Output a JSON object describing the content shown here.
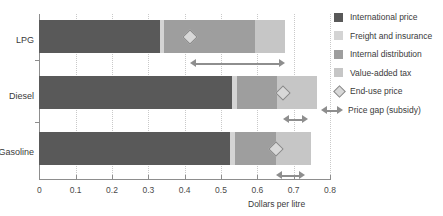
{
  "chart_data": {
    "type": "bar",
    "orientation": "horizontal",
    "stacked": true,
    "title": "",
    "xlabel": "Dollars per litre",
    "ylabel": "",
    "xlim": [
      0,
      0.8
    ],
    "xticks": [
      0,
      0.1,
      0.2,
      0.3,
      0.4,
      0.5,
      0.6,
      0.7,
      0.8
    ],
    "xtick_labels": [
      "0",
      "0.1",
      "0.2",
      "0.3",
      "0.4",
      "0.5",
      "0.6",
      "0.7",
      "0.8"
    ],
    "grid": "vertical-dotted",
    "legend_position": "right",
    "categories": [
      "LPG",
      "Diesel",
      "Gasoline"
    ],
    "series": [
      {
        "name": "International price",
        "color": "#595959",
        "values": [
          0.332,
          0.53,
          0.525
        ]
      },
      {
        "name": "Freight and insurance",
        "color": "#d4d4d4",
        "values": [
          0.012,
          0.015,
          0.013
        ]
      },
      {
        "name": "Internal distribution",
        "color": "#9e9e9e",
        "values": [
          0.249,
          0.109,
          0.113
        ]
      },
      {
        "name": "Value-added tax",
        "color": "#c6c6c6",
        "values": [
          0.083,
          0.11,
          0.097
        ]
      }
    ],
    "end_use_price": {
      "name": "End-use price",
      "marker": "diamond",
      "color": "#d8d8d8",
      "edge_color": "#8a8a8a",
      "values": [
        0.415,
        0.671,
        0.652
      ]
    },
    "price_gap": {
      "name": "Price gap (subsidy)",
      "color": "#8e8e8e",
      "ranges": [
        {
          "category": "LPG",
          "start": 0.415,
          "end": 0.676
        },
        {
          "category": "Diesel",
          "start": 0.671,
          "end": 0.74
        },
        {
          "category": "Gasoline",
          "start": 0.652,
          "end": 0.732
        }
      ]
    },
    "totals": [
      0.676,
      0.764,
      0.748
    ]
  },
  "axis": {
    "x_title": "Dollars per litre",
    "ticks": [
      "0",
      "0.1",
      "0.2",
      "0.3",
      "0.4",
      "0.5",
      "0.6",
      "0.7",
      "0.8"
    ]
  },
  "categories": {
    "lpg": "LPG",
    "diesel": "Diesel",
    "gasoline": "Gasoline"
  },
  "legend": {
    "items": [
      {
        "label": "International price",
        "swatch": "#595959",
        "kind": "swatch"
      },
      {
        "label": "Freight and insurance",
        "swatch": "#d4d4d4",
        "kind": "swatch"
      },
      {
        "label": "Internal distribution",
        "swatch": "#9e9e9e",
        "kind": "swatch"
      },
      {
        "label": "Value-added tax",
        "swatch": "#c6c6c6",
        "kind": "swatch"
      },
      {
        "label": "End-use price",
        "swatch": "#d8d8d8",
        "kind": "diamond"
      },
      {
        "label": "Price gap (subsidy)",
        "swatch": "#8e8e8e",
        "kind": "arrow"
      }
    ]
  }
}
